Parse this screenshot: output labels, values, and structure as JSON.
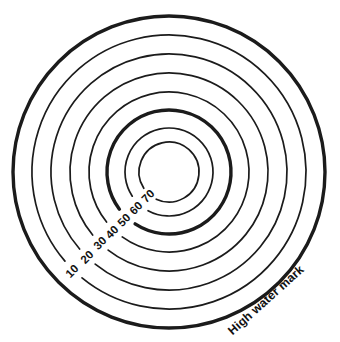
{
  "figure": {
    "kind": "contour-map",
    "background_color": "#ffffff",
    "line_color": "#1b1b1b",
    "width": 340,
    "height": 342
  },
  "annotations": {
    "high_water_mark": {
      "label": "High water mark",
      "icon": "none",
      "rotation_deg": -42,
      "x": 266,
      "y": 300
    }
  },
  "chart_data": {
    "type": "line",
    "subtype": "contour-map",
    "title": "",
    "subtitle": "",
    "xlabel": "",
    "ylabel": "",
    "grid": false,
    "legend_position": "none",
    "center": {
      "x": 169,
      "y": 172
    },
    "outer_boundary": {
      "label": "High water mark",
      "radius": 156,
      "stroke_width": 3.4,
      "emphasis": "thick"
    },
    "contours": [
      {
        "label": "10",
        "value": 10,
        "radius": 137.0,
        "stroke_width": 1.7,
        "emphasis": "thin",
        "label_x": 72,
        "label_y": 271,
        "label_rotation_deg": -45
      },
      {
        "label": "20",
        "value": 20,
        "radius": 118.0,
        "stroke_width": 1.7,
        "emphasis": "thin",
        "label_x": 87,
        "label_y": 257,
        "label_rotation_deg": -45
      },
      {
        "label": "30",
        "value": 30,
        "radius": 99.0,
        "stroke_width": 1.7,
        "emphasis": "thin",
        "label_x": 100,
        "label_y": 243,
        "label_rotation_deg": -45
      },
      {
        "label": "40",
        "value": 40,
        "radius": 80.0,
        "stroke_width": 1.7,
        "emphasis": "thin",
        "label_x": 112,
        "label_y": 232,
        "label_rotation_deg": -45
      },
      {
        "label": "50",
        "value": 50,
        "radius": 62.0,
        "stroke_width": 3.4,
        "emphasis": "thick",
        "label_x": 124,
        "label_y": 220,
        "label_rotation_deg": -45
      },
      {
        "label": "60",
        "value": 60,
        "radius": 44.0,
        "stroke_width": 1.7,
        "emphasis": "thin",
        "label_x": 136,
        "label_y": 208,
        "label_rotation_deg": -45
      },
      {
        "label": "70",
        "value": 70,
        "radius": 30.0,
        "stroke_width": 1.7,
        "emphasis": "thin",
        "label_x": 148,
        "label_y": 196,
        "label_rotation_deg": -45
      }
    ]
  }
}
